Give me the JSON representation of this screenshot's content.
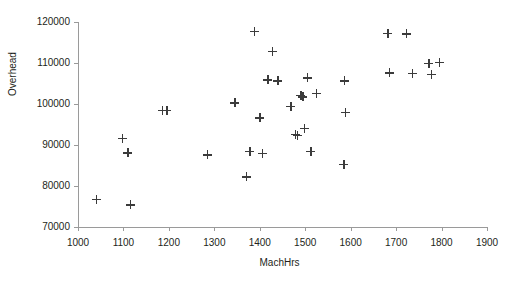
{
  "chart_data": {
    "type": "scatter",
    "title": "",
    "xlabel": "MachHrs",
    "ylabel": "Overhead",
    "xlim": [
      1000,
      1900
    ],
    "ylim": [
      70000,
      120000
    ],
    "xticks": [
      1000,
      1100,
      1200,
      1300,
      1400,
      1500,
      1600,
      1700,
      1800,
      1900
    ],
    "yticks": [
      70000,
      80000,
      90000,
      100000,
      110000,
      120000
    ],
    "grid": false,
    "legend": null,
    "marker": "plus",
    "marker_color": "#3b3b3b",
    "series": [
      {
        "name": "Overhead vs MachHrs",
        "points": [
          [
            1040,
            76800
          ],
          [
            1097,
            91700
          ],
          [
            1110,
            88100
          ],
          [
            1115,
            75400
          ],
          [
            1185,
            98500
          ],
          [
            1195,
            98400
          ],
          [
            1285,
            87600
          ],
          [
            1345,
            100300
          ],
          [
            1370,
            82200
          ],
          [
            1378,
            88500
          ],
          [
            1388,
            117800
          ],
          [
            1400,
            96600
          ],
          [
            1405,
            88000
          ],
          [
            1418,
            105900
          ],
          [
            1428,
            112900
          ],
          [
            1440,
            105700
          ],
          [
            1468,
            99400
          ],
          [
            1478,
            92600
          ],
          [
            1483,
            92400
          ],
          [
            1490,
            102100
          ],
          [
            1495,
            101800
          ],
          [
            1498,
            94100
          ],
          [
            1505,
            106400
          ],
          [
            1512,
            88400
          ],
          [
            1525,
            102600
          ],
          [
            1585,
            85300
          ],
          [
            1588,
            98000
          ],
          [
            1586,
            105700
          ],
          [
            1682,
            117200
          ],
          [
            1685,
            107600
          ],
          [
            1722,
            117100
          ],
          [
            1735,
            107500
          ],
          [
            1772,
            110000
          ],
          [
            1778,
            107200
          ],
          [
            1795,
            110100
          ]
        ]
      }
    ]
  },
  "axes": {
    "y_title": "Overhead",
    "x_title": "MachHrs"
  }
}
